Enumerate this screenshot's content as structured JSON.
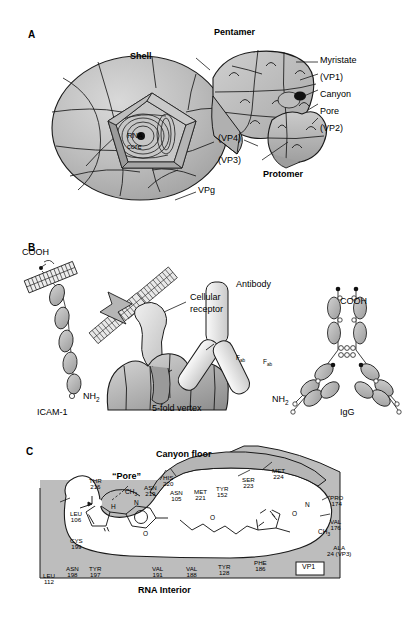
{
  "figure": {
    "panels": [
      {
        "id": "A",
        "letter": "A"
      },
      {
        "id": "B",
        "letter": "B"
      },
      {
        "id": "C",
        "letter": "C"
      }
    ]
  },
  "panelA": {
    "letter": "A",
    "labels": {
      "shell": "Shell",
      "pentamer": "Pentamer",
      "protomer": "Protomer",
      "myristate": "Myristate",
      "vp1": "(VP1)",
      "canyon": "Canyon",
      "pore": "Pore",
      "vp2": "(VP2)",
      "vp3": "(VP3)",
      "vp4": "(VP4)",
      "rna": "RNA",
      "core": "core",
      "vpg": "VPg"
    }
  },
  "panelB": {
    "letter": "B",
    "labels": {
      "cooh_left": "COOH",
      "nh2_left": "NH",
      "nh2_left_sub": "2",
      "icam": "ICAM-1",
      "cellular_receptor_line1": "Cellular",
      "cellular_receptor_line2": "receptor",
      "antibody": "Antibody",
      "fab1": "F",
      "fab1_sub": "ab",
      "fab2": "F",
      "fab2_sub": "ab",
      "vertex": "5-fold vertex",
      "cooh_right": "COOH",
      "nh2_right": "NH",
      "nh2_right_sub": "2",
      "igg": "IgG"
    }
  },
  "panelC": {
    "letter": "C",
    "labels": {
      "canyon_floor": "Canyon floor",
      "pore": "“Pore”",
      "rna_interior": "RNA Interior",
      "vp1_box": "VP1"
    },
    "chem": {
      "ch3_left": "CH",
      "ch3_left_sub": "3",
      "h_left": "H",
      "n_left": "N",
      "o_ring_left": "O",
      "o_ether": "O",
      "o_isox": "O",
      "n_isox": "N",
      "ch3_right": "CH",
      "ch3_right_sub": "3"
    },
    "residues": {
      "canyon": [
        {
          "name": "HIS",
          "num": "220"
        },
        {
          "name": "ASN",
          "num": "219"
        },
        {
          "name": "ASN",
          "num": "105"
        },
        {
          "name": "MET",
          "num": "221"
        },
        {
          "name": "TYR",
          "num": "152"
        },
        {
          "name": "SER",
          "num": "223"
        },
        {
          "name": "MET",
          "num": "224"
        }
      ],
      "left": [
        {
          "name": "THR",
          "num": "216"
        },
        {
          "name": "LEU",
          "num": "106"
        },
        {
          "name": "CYS",
          "num": "199"
        }
      ],
      "right": [
        {
          "name": "PRO",
          "num": "174"
        },
        {
          "name": "VAL",
          "num": "176"
        },
        {
          "name": "ALA",
          "num": "24  (VP3)"
        }
      ],
      "bottom": [
        {
          "name": "LEU",
          "num": "112"
        },
        {
          "name": "ASN",
          "num": "198"
        },
        {
          "name": "TYR",
          "num": "197"
        },
        {
          "name": "VAL",
          "num": "191"
        },
        {
          "name": "VAL",
          "num": "188"
        },
        {
          "name": "TYR",
          "num": "128"
        },
        {
          "name": "PHE",
          "num": "186"
        }
      ]
    }
  },
  "colors": {
    "shell_gray": "#b3b3b3",
    "light_gray": "#d8d8d8",
    "mid_gray": "#c2c2c2",
    "dark_gray": "#8f8f8f",
    "outline": "#1a1a1a",
    "white": "#ffffff"
  }
}
